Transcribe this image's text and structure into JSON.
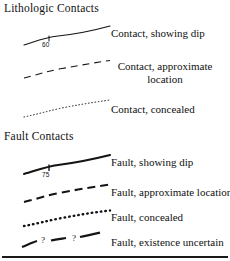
{
  "legend": {
    "title_visible": false,
    "sections": [
      {
        "id": "lithologic",
        "header": "Lithologic Contacts",
        "entries": [
          {
            "symbol": "solid-curved-line-with-dip-tick",
            "dip_value": "60",
            "label": "Contact, showing dip"
          },
          {
            "symbol": "dashed-curved-line",
            "label": "Contact, approximate location"
          },
          {
            "symbol": "dotted-curved-line",
            "label": "Contact, concealed"
          }
        ]
      },
      {
        "id": "fault",
        "header": "Fault Contacts",
        "entries": [
          {
            "symbol": "thick-solid-curved-line-with-dip-tick",
            "dip_value": "75",
            "label": "Fault, showing dip"
          },
          {
            "symbol": "thick-dashed-curved-line",
            "label": "Fault, approximate location"
          },
          {
            "symbol": "thick-dotted-curved-line",
            "label": "Fault, concealed"
          },
          {
            "symbol": "thick-dashed-curved-line-with-question-marks",
            "query_marks": [
              "?",
              "?"
            ],
            "label": "Fault, existence uncertain"
          }
        ]
      }
    ],
    "colors": {
      "ink": "#101010",
      "background": "#ffffff",
      "rule": "#1a1a1a"
    }
  }
}
